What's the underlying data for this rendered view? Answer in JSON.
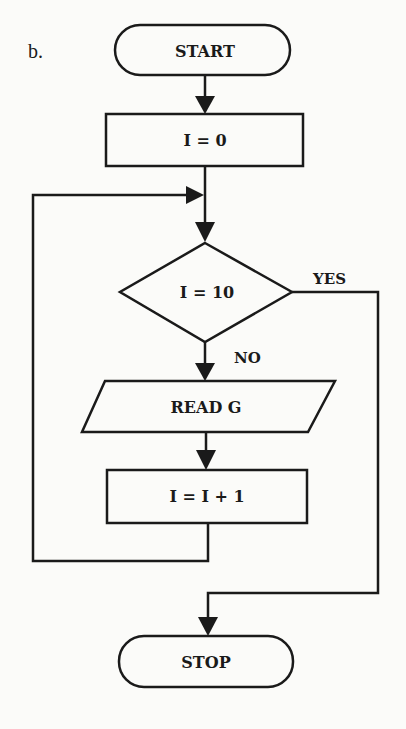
{
  "figure": {
    "label": "b."
  },
  "nodes": {
    "start": {
      "type": "terminal",
      "text": "START"
    },
    "init": {
      "type": "process",
      "text": "I = 0"
    },
    "decision": {
      "type": "decision",
      "text": "I = 10"
    },
    "read": {
      "type": "input",
      "text": "READ G"
    },
    "increment": {
      "type": "process",
      "text": "I = I + 1"
    },
    "stop": {
      "type": "terminal",
      "text": "STOP"
    }
  },
  "edges": {
    "yes_label": "YES",
    "no_label": "NO"
  },
  "colors": {
    "ink": "#1a1a1a",
    "paper": "#fbfbf9"
  }
}
